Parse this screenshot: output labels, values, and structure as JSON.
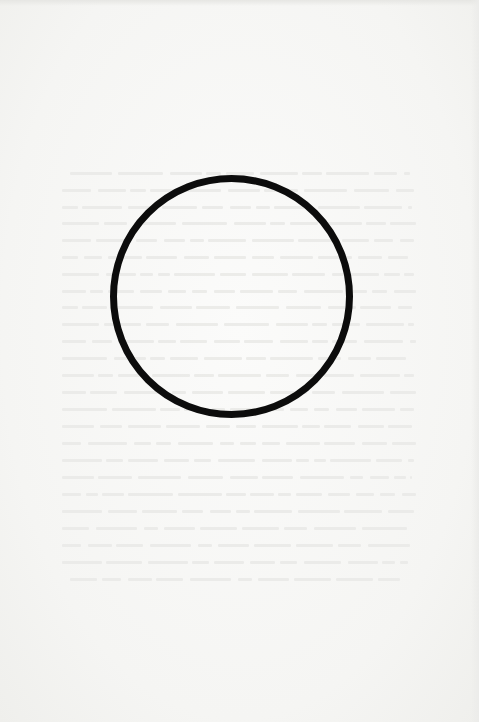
{
  "page": {
    "background": "#f6f6f4",
    "bleed_through_text": {
      "legible": false,
      "color": "#e9e9e6",
      "lines": [
        {
          "x": 70,
          "y": 172,
          "w": 340
        },
        {
          "x": 62,
          "y": 189,
          "w": 352
        },
        {
          "x": 62,
          "y": 206,
          "w": 350
        },
        {
          "x": 62,
          "y": 222,
          "w": 354
        },
        {
          "x": 62,
          "y": 239,
          "w": 352
        },
        {
          "x": 62,
          "y": 256,
          "w": 350
        },
        {
          "x": 62,
          "y": 273,
          "w": 352
        },
        {
          "x": 62,
          "y": 290,
          "w": 354
        },
        {
          "x": 62,
          "y": 306,
          "w": 350
        },
        {
          "x": 62,
          "y": 323,
          "w": 352
        },
        {
          "x": 62,
          "y": 340,
          "w": 354
        },
        {
          "x": 62,
          "y": 357,
          "w": 350
        },
        {
          "x": 62,
          "y": 374,
          "w": 352
        },
        {
          "x": 62,
          "y": 391,
          "w": 354
        },
        {
          "x": 62,
          "y": 408,
          "w": 352
        },
        {
          "x": 62,
          "y": 425,
          "w": 350
        },
        {
          "x": 62,
          "y": 442,
          "w": 354
        },
        {
          "x": 62,
          "y": 459,
          "w": 352
        },
        {
          "x": 62,
          "y": 476,
          "w": 350
        },
        {
          "x": 62,
          "y": 493,
          "w": 354
        },
        {
          "x": 62,
          "y": 510,
          "w": 352
        },
        {
          "x": 62,
          "y": 527,
          "w": 350
        },
        {
          "x": 62,
          "y": 544,
          "w": 352
        },
        {
          "x": 62,
          "y": 561,
          "w": 346
        },
        {
          "x": 70,
          "y": 578,
          "w": 330
        }
      ]
    },
    "circle": {
      "center_x": 231,
      "center_y": 296,
      "radius": 118,
      "stroke_width": 7,
      "stroke_color": "#0c0c0c"
    }
  }
}
